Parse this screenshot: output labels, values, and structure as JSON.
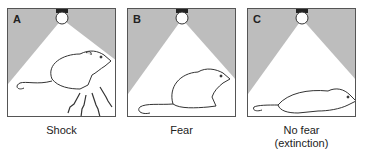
{
  "figure": {
    "panels": [
      {
        "letter": "A",
        "caption": "Shock",
        "caption_line2": ""
      },
      {
        "letter": "B",
        "caption": "Fear",
        "caption_line2": ""
      },
      {
        "letter": "C",
        "caption": "No fear",
        "caption_line2": "(extinction)"
      }
    ],
    "colors": {
      "background": "#bdbdbd",
      "light_cone": "#ffffff",
      "border": "#555555"
    }
  }
}
